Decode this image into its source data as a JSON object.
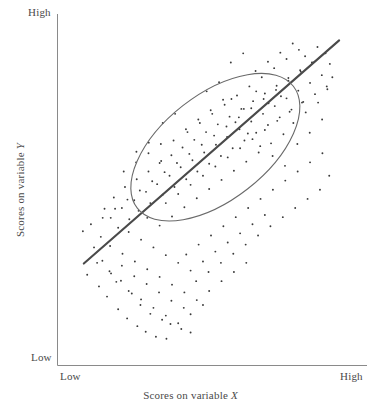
{
  "chart_data": {
    "type": "scatter",
    "title": "",
    "subtitle": "",
    "xlabel": "Scores on variable X",
    "ylabel": "Scores on variable Y",
    "xlabel_text": "Scores on variable ",
    "xlabel_symbol": "X",
    "ylabel_text": "Scores on variable ",
    "ylabel_symbol": "Y",
    "x_tick_labels": [
      "Low",
      "High"
    ],
    "y_tick_labels": [
      "Low",
      "High"
    ],
    "xlim": [
      0,
      1
    ],
    "ylim": [
      0,
      1
    ],
    "grid": false,
    "legend": "none",
    "annotations": [
      {
        "name": "regression-line",
        "description": "Ascending best-fit line through the cloud",
        "x0": 0.085,
        "y0": 0.29,
        "x1": 0.91,
        "y1": 0.925
      },
      {
        "name": "concentration-ellipse",
        "description": "Ellipse enclosing the data cloud indicating a strong positive correlation",
        "cx": 0.51,
        "cy": 0.621,
        "rx": 0.64,
        "ry": 0.3,
        "rotation_deg": -38
      }
    ],
    "marker": {
      "shape": "dot",
      "size_px": 1.9,
      "color": "#3a3a3a"
    },
    "line_color": "#4a4a4a",
    "ellipse_color": "#6a6a6a",
    "axis_color": "#8a8a8a",
    "background": "#ffffff",
    "n_points": 231,
    "points": [
      [
        0.118,
        0.336
      ],
      [
        0.096,
        0.258
      ],
      [
        0.145,
        0.298
      ],
      [
        0.173,
        0.262
      ],
      [
        0.134,
        0.225
      ],
      [
        0.205,
        0.241
      ],
      [
        0.16,
        0.196
      ],
      [
        0.24,
        0.205
      ],
      [
        0.196,
        0.16
      ],
      [
        0.268,
        0.172
      ],
      [
        0.225,
        0.134
      ],
      [
        0.3,
        0.147
      ],
      [
        0.258,
        0.112
      ],
      [
        0.338,
        0.13
      ],
      [
        0.285,
        0.096
      ],
      [
        0.365,
        0.118
      ],
      [
        0.318,
        0.082
      ],
      [
        0.4,
        0.104
      ],
      [
        0.352,
        0.076
      ],
      [
        0.43,
        0.094
      ],
      [
        0.082,
        0.382
      ],
      [
        0.108,
        0.402
      ],
      [
        0.14,
        0.366
      ],
      [
        0.172,
        0.42
      ],
      [
        0.152,
        0.446
      ],
      [
        0.196,
        0.392
      ],
      [
        0.208,
        0.448
      ],
      [
        0.182,
        0.478
      ],
      [
        0.232,
        0.416
      ],
      [
        0.248,
        0.47
      ],
      [
        0.218,
        0.508
      ],
      [
        0.262,
        0.44
      ],
      [
        0.286,
        0.494
      ],
      [
        0.256,
        0.53
      ],
      [
        0.3,
        0.462
      ],
      [
        0.322,
        0.516
      ],
      [
        0.294,
        0.552
      ],
      [
        0.34,
        0.486
      ],
      [
        0.362,
        0.54
      ],
      [
        0.33,
        0.576
      ],
      [
        0.378,
        0.508
      ],
      [
        0.398,
        0.564
      ],
      [
        0.368,
        0.598
      ],
      [
        0.416,
        0.53
      ],
      [
        0.436,
        0.584
      ],
      [
        0.404,
        0.62
      ],
      [
        0.452,
        0.552
      ],
      [
        0.474,
        0.606
      ],
      [
        0.442,
        0.642
      ],
      [
        0.49,
        0.574
      ],
      [
        0.512,
        0.628
      ],
      [
        0.48,
        0.664
      ],
      [
        0.528,
        0.596
      ],
      [
        0.548,
        0.65
      ],
      [
        0.518,
        0.686
      ],
      [
        0.566,
        0.618
      ],
      [
        0.588,
        0.672
      ],
      [
        0.556,
        0.708
      ],
      [
        0.604,
        0.64
      ],
      [
        0.626,
        0.694
      ],
      [
        0.594,
        0.73
      ],
      [
        0.642,
        0.662
      ],
      [
        0.664,
        0.716
      ],
      [
        0.632,
        0.752
      ],
      [
        0.68,
        0.684
      ],
      [
        0.702,
        0.738
      ],
      [
        0.67,
        0.774
      ],
      [
        0.718,
        0.706
      ],
      [
        0.74,
        0.76
      ],
      [
        0.708,
        0.796
      ],
      [
        0.756,
        0.728
      ],
      [
        0.778,
        0.782
      ],
      [
        0.746,
        0.818
      ],
      [
        0.794,
        0.75
      ],
      [
        0.816,
        0.804
      ],
      [
        0.784,
        0.84
      ],
      [
        0.832,
        0.772
      ],
      [
        0.854,
        0.826
      ],
      [
        0.822,
        0.862
      ],
      [
        0.87,
        0.794
      ],
      [
        0.17,
        0.34
      ],
      [
        0.21,
        0.318
      ],
      [
        0.25,
        0.296
      ],
      [
        0.29,
        0.274
      ],
      [
        0.33,
        0.252
      ],
      [
        0.37,
        0.23
      ],
      [
        0.41,
        0.208
      ],
      [
        0.45,
        0.186
      ],
      [
        0.49,
        0.212
      ],
      [
        0.53,
        0.24
      ],
      [
        0.57,
        0.266
      ],
      [
        0.61,
        0.292
      ],
      [
        0.23,
        0.38
      ],
      [
        0.27,
        0.358
      ],
      [
        0.31,
        0.336
      ],
      [
        0.35,
        0.314
      ],
      [
        0.39,
        0.292
      ],
      [
        0.43,
        0.27
      ],
      [
        0.47,
        0.296
      ],
      [
        0.51,
        0.324
      ],
      [
        0.55,
        0.35
      ],
      [
        0.59,
        0.376
      ],
      [
        0.63,
        0.402
      ],
      [
        0.67,
        0.428
      ],
      [
        0.29,
        0.42
      ],
      [
        0.33,
        0.398
      ],
      [
        0.37,
        0.424
      ],
      [
        0.41,
        0.45
      ],
      [
        0.45,
        0.476
      ],
      [
        0.49,
        0.502
      ],
      [
        0.53,
        0.528
      ],
      [
        0.57,
        0.554
      ],
      [
        0.61,
        0.58
      ],
      [
        0.65,
        0.606
      ],
      [
        0.69,
        0.632
      ],
      [
        0.73,
        0.658
      ],
      [
        0.35,
        0.462
      ],
      [
        0.39,
        0.488
      ],
      [
        0.43,
        0.514
      ],
      [
        0.47,
        0.54
      ],
      [
        0.51,
        0.566
      ],
      [
        0.55,
        0.592
      ],
      [
        0.59,
        0.618
      ],
      [
        0.63,
        0.644
      ],
      [
        0.67,
        0.67
      ],
      [
        0.71,
        0.696
      ],
      [
        0.75,
        0.722
      ],
      [
        0.79,
        0.748
      ],
      [
        0.416,
        0.316
      ],
      [
        0.456,
        0.344
      ],
      [
        0.496,
        0.37
      ],
      [
        0.536,
        0.396
      ],
      [
        0.576,
        0.422
      ],
      [
        0.616,
        0.448
      ],
      [
        0.656,
        0.474
      ],
      [
        0.696,
        0.5
      ],
      [
        0.736,
        0.526
      ],
      [
        0.776,
        0.552
      ],
      [
        0.816,
        0.578
      ],
      [
        0.856,
        0.604
      ],
      [
        0.146,
        0.42
      ],
      [
        0.186,
        0.446
      ],
      [
        0.226,
        0.472
      ],
      [
        0.266,
        0.498
      ],
      [
        0.306,
        0.524
      ],
      [
        0.346,
        0.55
      ],
      [
        0.386,
        0.576
      ],
      [
        0.426,
        0.602
      ],
      [
        0.466,
        0.628
      ],
      [
        0.506,
        0.654
      ],
      [
        0.546,
        0.68
      ],
      [
        0.586,
        0.706
      ],
      [
        0.626,
        0.732
      ],
      [
        0.666,
        0.758
      ],
      [
        0.706,
        0.784
      ],
      [
        0.746,
        0.81
      ],
      [
        0.786,
        0.836
      ],
      [
        0.826,
        0.862
      ],
      [
        0.866,
        0.888
      ],
      [
        0.88,
        0.858
      ],
      [
        0.34,
        0.69
      ],
      [
        0.38,
        0.716
      ],
      [
        0.42,
        0.664
      ],
      [
        0.46,
        0.69
      ],
      [
        0.5,
        0.716
      ],
      [
        0.54,
        0.742
      ],
      [
        0.58,
        0.768
      ],
      [
        0.62,
        0.794
      ],
      [
        0.66,
        0.82
      ],
      [
        0.7,
        0.846
      ],
      [
        0.74,
        0.872
      ],
      [
        0.78,
        0.898
      ],
      [
        0.56,
        0.862
      ],
      [
        0.6,
        0.888
      ],
      [
        0.64,
        0.838
      ],
      [
        0.68,
        0.864
      ],
      [
        0.72,
        0.89
      ],
      [
        0.76,
        0.916
      ],
      [
        0.8,
        0.88
      ],
      [
        0.84,
        0.906
      ],
      [
        0.19,
        0.238
      ],
      [
        0.23,
        0.212
      ],
      [
        0.27,
        0.188
      ],
      [
        0.31,
        0.164
      ],
      [
        0.35,
        0.142
      ],
      [
        0.39,
        0.12
      ],
      [
        0.43,
        0.146
      ],
      [
        0.47,
        0.172
      ],
      [
        0.255,
        0.608
      ],
      [
        0.295,
        0.634
      ],
      [
        0.335,
        0.582
      ],
      [
        0.375,
        0.64
      ],
      [
        0.415,
        0.672
      ],
      [
        0.455,
        0.7
      ],
      [
        0.495,
        0.726
      ],
      [
        0.535,
        0.756
      ],
      [
        0.575,
        0.692
      ],
      [
        0.615,
        0.66
      ],
      [
        0.655,
        0.624
      ],
      [
        0.695,
        0.596
      ],
      [
        0.735,
        0.568
      ],
      [
        0.775,
        0.63
      ],
      [
        0.815,
        0.662
      ],
      [
        0.855,
        0.7
      ],
      [
        0.482,
        0.78
      ],
      [
        0.522,
        0.806
      ],
      [
        0.562,
        0.758
      ],
      [
        0.602,
        0.73
      ],
      [
        0.642,
        0.78
      ],
      [
        0.682,
        0.746
      ],
      [
        0.722,
        0.766
      ],
      [
        0.762,
        0.69
      ],
      [
        0.802,
        0.72
      ],
      [
        0.842,
        0.748
      ],
      [
        0.872,
        0.786
      ],
      [
        0.888,
        0.82
      ],
      [
        0.128,
        0.292
      ],
      [
        0.168,
        0.268
      ],
      [
        0.208,
        0.284
      ],
      [
        0.248,
        0.254
      ],
      [
        0.288,
        0.232
      ],
      [
        0.328,
        0.208
      ],
      [
        0.368,
        0.184
      ],
      [
        0.408,
        0.164
      ],
      [
        0.448,
        0.24
      ],
      [
        0.488,
        0.266
      ],
      [
        0.528,
        0.292
      ],
      [
        0.568,
        0.318
      ],
      [
        0.608,
        0.344
      ],
      [
        0.648,
        0.37
      ],
      [
        0.688,
        0.396
      ],
      [
        0.728,
        0.422
      ],
      [
        0.768,
        0.448
      ],
      [
        0.808,
        0.474
      ],
      [
        0.848,
        0.5
      ],
      [
        0.878,
        0.54
      ],
      [
        0.214,
        0.552
      ],
      [
        0.254,
        0.578
      ],
      [
        0.294,
        0.604
      ],
      [
        0.334,
        0.63
      ]
    ]
  },
  "axes": {
    "y_high_label": "High",
    "y_low_label": "Low",
    "x_low_label": "Low",
    "x_high_label": "High"
  }
}
